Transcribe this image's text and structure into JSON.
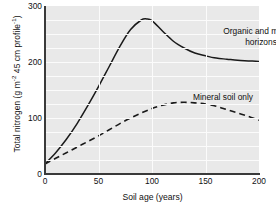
{
  "chart_data": {
    "type": "line",
    "title": "",
    "xlabel": "Soil age (years)",
    "ylabel": "Total nitrogen (g m⁻² 45 cm profile⁻¹)",
    "ylabel_parts": {
      "prefix": "Total nitrogen (g m",
      "sup1": "-2",
      "mid": " 45 cm profile",
      "sup2": "-1",
      "suffix": ")"
    },
    "xlim": [
      0,
      200
    ],
    "ylim": [
      0,
      300
    ],
    "xticks": [
      0,
      50,
      100,
      150,
      200
    ],
    "xtick_labels": [
      "0",
      "50",
      "100",
      "150",
      "200"
    ],
    "yticks": [
      0,
      100,
      200,
      300
    ],
    "ytick_labels": [
      "0",
      "100",
      "200",
      "300"
    ],
    "grid": "on",
    "grid_color": "#fbfbfb",
    "grid_x_values": [
      50,
      100,
      150
    ],
    "grid_y_values": [
      25,
      50,
      75,
      100,
      125,
      150,
      175,
      200,
      225,
      250,
      275
    ],
    "plot_background": "#e9e9e9",
    "axis_color": "#3a3a3a",
    "legend": "annotations-on-plot",
    "legend_position": "in-plot",
    "series": [
      {
        "name": "Organic and mineral horizons",
        "style": "solid",
        "color": "#1a1a1a",
        "annotation": "Organic and mineral\nhorizons",
        "x": [
          0,
          10,
          20,
          30,
          40,
          50,
          60,
          70,
          80,
          90,
          95,
          100,
          110,
          120,
          130,
          140,
          150,
          160,
          170,
          180,
          190,
          200
        ],
        "y": [
          18,
          38,
          62,
          90,
          122,
          156,
          192,
          228,
          258,
          275,
          277,
          274,
          255,
          237,
          225,
          216,
          211,
          207,
          205,
          203,
          202,
          201
        ]
      },
      {
        "name": "Mineral soil only",
        "style": "dashed",
        "color": "#1a1a1a",
        "annotation": "Mineral soil only",
        "x": [
          0,
          10,
          20,
          30,
          40,
          50,
          60,
          70,
          80,
          90,
          100,
          110,
          120,
          130,
          140,
          150,
          160,
          170,
          180,
          190,
          200
        ],
        "y": [
          18,
          28,
          38,
          48,
          58,
          68,
          79,
          90,
          100,
          109,
          117,
          123,
          127,
          128,
          127,
          125,
          121,
          115,
          109,
          103,
          96
        ]
      }
    ]
  }
}
